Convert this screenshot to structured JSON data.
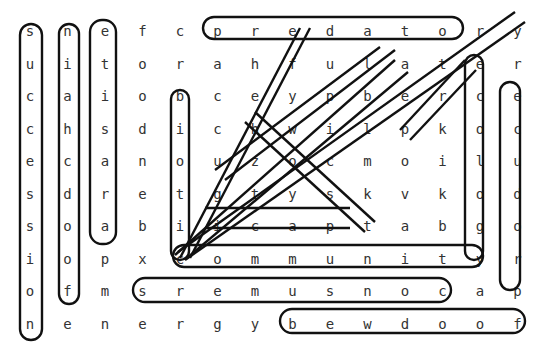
{
  "puzzle": {
    "type": "word-search",
    "rows": 10,
    "cols": 14,
    "grid": [
      [
        "s",
        "n",
        "e",
        "f",
        "c",
        "p",
        "r",
        "e",
        "d",
        "a",
        "t",
        "o",
        "r",
        "y"
      ],
      [
        "u",
        "i",
        "t",
        "o",
        "r",
        "a",
        "h",
        "f",
        "u",
        "l",
        "a",
        "t",
        "e",
        "r"
      ],
      [
        "c",
        "a",
        "i",
        "o",
        "b",
        "c",
        "e",
        "y",
        "p",
        "b",
        "e",
        "r",
        "c",
        "e"
      ],
      [
        "c",
        "h",
        "s",
        "d",
        "i",
        "c",
        "h",
        "w",
        "i",
        "l",
        "p",
        "k",
        "o",
        "c"
      ],
      [
        "e",
        "c",
        "a",
        "n",
        "o",
        "u",
        "z",
        "o",
        "c",
        "m",
        "o",
        "i",
        "l",
        "u"
      ],
      [
        "s",
        "d",
        "r",
        "e",
        "t",
        "g",
        "t",
        "y",
        "s",
        "k",
        "v",
        "k",
        "o",
        "d"
      ],
      [
        "s",
        "o",
        "a",
        "b",
        "i",
        "i",
        "c",
        "a",
        "p",
        "t",
        "a",
        "b",
        "g",
        "o"
      ],
      [
        "i",
        "o",
        "p",
        "x",
        "c",
        "o",
        "m",
        "m",
        "u",
        "n",
        "i",
        "t",
        "y",
        "r"
      ],
      [
        "o",
        "f",
        "m",
        "s",
        "r",
        "e",
        "m",
        "u",
        "s",
        "n",
        "o",
        "c",
        "a",
        "p"
      ],
      [
        "n",
        "e",
        "n",
        "e",
        "r",
        "g",
        "y",
        "b",
        "e",
        "w",
        "d",
        "o",
        "o",
        "f"
      ]
    ],
    "found_words": [
      {
        "word": "succession",
        "start": [
          0,
          0
        ],
        "end": [
          9,
          0
        ]
      },
      {
        "word": "niachcdoof",
        "start": [
          0,
          1
        ],
        "end": [
          8,
          1
        ]
      },
      {
        "word": "etisarap",
        "start": [
          0,
          2
        ],
        "end": [
          7,
          2
        ]
      },
      {
        "word": "predator",
        "start": [
          0,
          5
        ],
        "end": [
          0,
          12
        ]
      },
      {
        "word": "biotic",
        "start": [
          2,
          4
        ],
        "end": [
          7,
          4
        ]
      },
      {
        "word": "community",
        "start": [
          7,
          4
        ],
        "end": [
          7,
          12
        ]
      },
      {
        "word": "consumers",
        "start": [
          8,
          11
        ],
        "end": [
          8,
          3
        ]
      },
      {
        "word": "foodweb",
        "start": [
          9,
          13
        ],
        "end": [
          9,
          7
        ]
      },
      {
        "word": "ecology",
        "start": [
          1,
          12
        ],
        "end": [
          7,
          12
        ]
      },
      {
        "word": "decompose",
        "start": [
          2,
          13
        ],
        "end": [
          8,
          13
        ]
      },
      {
        "word": "herbivore",
        "start": [
          1,
          6
        ],
        "end": [
          7,
          4
        ]
      },
      {
        "word": "hostcap",
        "start": [
          3,
          6
        ],
        "end": [
          6,
          9
        ]
      },
      {
        "word": "producer",
        "start": [
          3,
          10
        ],
        "end": [
          7,
          4
        ]
      },
      {
        "word": "alpine",
        "start": [
          1,
          10
        ],
        "end": [
          4,
          3
        ]
      },
      {
        "word": "yeast",
        "start": [
          0,
          13
        ],
        "end": [
          7,
          4
        ]
      },
      {
        "word": "cap-i",
        "start": [
          6,
          6
        ],
        "end": [
          6,
          9
        ]
      }
    ]
  }
}
